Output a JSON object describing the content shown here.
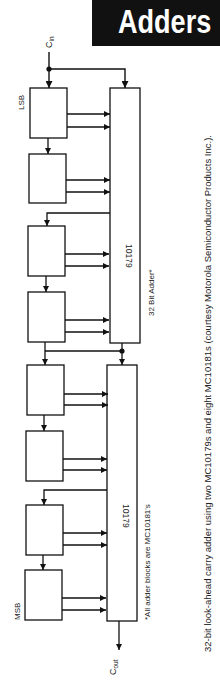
{
  "header": {
    "title": "Adders"
  },
  "diagram": {
    "labels": {
      "carry_in": "C",
      "carry_in_sub": "in",
      "carry_out": "C",
      "carry_out_sub": "out",
      "lsb": "LSB",
      "msb": "MSB",
      "lookahead_upper": "10179",
      "lookahead_lower": "10179",
      "adder_title": "32 Bit Adder*",
      "footnote": "*All adder blocks are MC10181's"
    },
    "adder_blocks": [
      {
        "id": 1,
        "y": 88,
        "h": 50
      },
      {
        "id": 2,
        "y": 154,
        "h": 49
      },
      {
        "id": 3,
        "y": 226,
        "h": 50
      },
      {
        "id": 4,
        "y": 292,
        "h": 50
      },
      {
        "id": 5,
        "y": 365,
        "h": 50
      },
      {
        "id": 6,
        "y": 431,
        "h": 50
      },
      {
        "id": 7,
        "y": 505,
        "h": 50
      },
      {
        "id": 8,
        "y": 570,
        "h": 50
      }
    ],
    "lookahead_units": [
      {
        "id": "upper",
        "y": 88,
        "h": 255
      },
      {
        "id": "lower",
        "y": 365,
        "h": 256
      }
    ]
  },
  "caption": "32-bit look-ahead carry adder using two MC10179s and eight MC10181s (courtesy Motorola Semiconductor Products Inc.)."
}
